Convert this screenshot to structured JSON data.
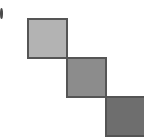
{
  "figure": {
    "name": "diagonal-staircase-squares",
    "width": 144,
    "height": 140,
    "background_color": "#ffffff",
    "border_color": "#555555",
    "border_width": 2,
    "squares": [
      {
        "label": "square-1",
        "position": "top-left",
        "fill_color": "#b3b3b3",
        "x": 27,
        "y": 18,
        "size": 41
      },
      {
        "label": "square-2",
        "position": "middle",
        "fill_color": "#8c8c8c",
        "x": 66,
        "y": 57,
        "size": 41
      },
      {
        "label": "square-3",
        "position": "bottom-right",
        "fill_color": "#6e6e6e",
        "x": 105,
        "y": 96,
        "size": 41
      }
    ],
    "edge_mark": {
      "label": "left-edge-glyph",
      "fill_color": "#4a4a4a",
      "x": 0,
      "y": 8,
      "width": 3,
      "height": 11
    }
  }
}
